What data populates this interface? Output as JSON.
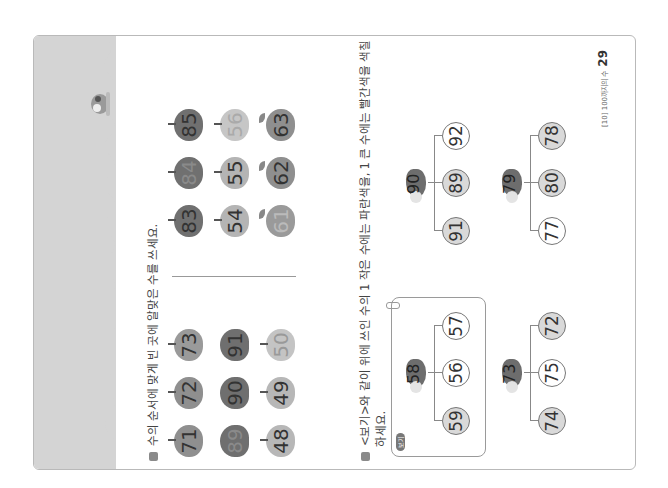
{
  "page": {
    "footer_label": "[10] 100까지의 수",
    "page_number": "29",
    "colors": {
      "header_band": "#d4d4d4",
      "apple_dark": "#7a7a7a",
      "apple_mid": "#9c9c9c",
      "apple_light": "#c4c4c4",
      "shaded_circle": "#d9d9d9"
    }
  },
  "section1": {
    "instruction": "수의 순서에 맞게 빈 곳에 알맞은 수를 쓰세요.",
    "groups": [
      {
        "rows": [
          [
            "71",
            "72",
            "73"
          ],
          [
            "89",
            "90",
            "91"
          ],
          [
            "48",
            "49",
            "50"
          ]
        ]
      },
      {
        "rows": [
          [
            "83",
            "84",
            "85"
          ],
          [
            "54",
            "55",
            "56"
          ],
          [
            "61",
            "62",
            "63"
          ]
        ]
      }
    ]
  },
  "section2": {
    "instruction_line1": "<보기>와 같이 위에 쓰인 수의 1 작은 수에는 파란색을, 1 큰 수에는 빨간색을 색칠",
    "instruction_line2": "하세요.",
    "example_badge": "보기",
    "trees": [
      {
        "bird": "58",
        "choices": [
          "59",
          "56",
          "57"
        ],
        "shaded": [
          true,
          false,
          false
        ],
        "is_example": true
      },
      {
        "bird": "90",
        "choices": [
          "91",
          "89",
          "92"
        ],
        "shaded": [
          true,
          true,
          false
        ],
        "is_example": false
      },
      {
        "bird": "73",
        "choices": [
          "74",
          "75",
          "72"
        ],
        "shaded": [
          true,
          false,
          true
        ],
        "is_example": false
      },
      {
        "bird": "79",
        "choices": [
          "77",
          "80",
          "78"
        ],
        "shaded": [
          false,
          true,
          true
        ],
        "is_example": false
      }
    ]
  }
}
